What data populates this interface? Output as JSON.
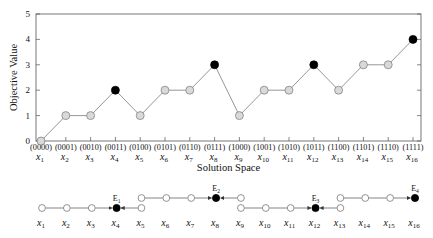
{
  "chart_data": {
    "type": "line",
    "title": "",
    "xlabel": "Solution Space",
    "ylabel": "Objective Value",
    "ylim": [
      0,
      5
    ],
    "yticks": [
      "0",
      "1",
      "2",
      "3",
      "4",
      "5"
    ],
    "grid": false,
    "categories": [
      "x1",
      "x2",
      "x3",
      "x4",
      "x5",
      "x6",
      "x7",
      "x8",
      "x9",
      "x10",
      "x11",
      "x12",
      "x13",
      "x14",
      "x15",
      "x16"
    ],
    "binary_labels": [
      "(0000)",
      "(0001)",
      "(0010)",
      "(0011)",
      "(0100)",
      "(0101)",
      "(0110)",
      "(0111)",
      "(1000)",
      "(1001)",
      "(1010)",
      "(1011)",
      "(1100)",
      "(1101)",
      "(1110)",
      "(1111)"
    ],
    "values": [
      0,
      1,
      1,
      2,
      1,
      2,
      2,
      3,
      1,
      2,
      2,
      3,
      2,
      3,
      3,
      4
    ],
    "local_optima": [
      "x4",
      "x8",
      "x12",
      "x16"
    ],
    "marker_colors": {
      "normal": "#d9d9d9",
      "optimum": "#000000",
      "line": "#8a8a8a"
    }
  },
  "axis": {
    "x_title": "Solution Space",
    "y_title": "Objective Value"
  },
  "basin_diagram": {
    "attractors": [
      {
        "label": "E1",
        "node": "x4"
      },
      {
        "label": "E2",
        "node": "x8"
      },
      {
        "label": "E3",
        "node": "x12"
      },
      {
        "label": "E4",
        "node": "x16"
      }
    ],
    "node_labels": [
      "x1",
      "x2",
      "x3",
      "x4",
      "x5",
      "x6",
      "x7",
      "x8",
      "x9",
      "x10",
      "x11",
      "x12",
      "x13",
      "x14",
      "x15",
      "x16"
    ],
    "basins": [
      {
        "attractor": "E1",
        "members": [
          "x1",
          "x2",
          "x3",
          "x4",
          "x5"
        ]
      },
      {
        "attractor": "E2",
        "members": [
          "x5",
          "x6",
          "x7",
          "x8",
          "x9"
        ]
      },
      {
        "attractor": "E3",
        "members": [
          "x9",
          "x10",
          "x11",
          "x12",
          "x13"
        ]
      },
      {
        "attractor": "E4",
        "members": [
          "x13",
          "x14",
          "x15",
          "x16"
        ]
      }
    ]
  }
}
